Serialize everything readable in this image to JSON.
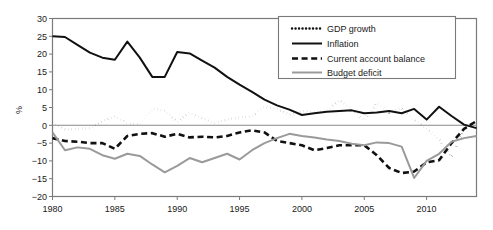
{
  "chart_data": {
    "type": "line",
    "title": "",
    "xlabel": "",
    "ylabel": "%",
    "xlim": [
      1980,
      2014
    ],
    "ylim": [
      -20,
      30
    ],
    "ytick_step": 5,
    "yticks": [
      30,
      25,
      20,
      15,
      10,
      5,
      0,
      -5,
      -10,
      -15,
      -20
    ],
    "xticks": [
      1980,
      1985,
      1990,
      1995,
      2000,
      2005,
      2010
    ],
    "grid": false,
    "zero_line": true,
    "legend_position": "top-right",
    "x": [
      1980,
      1981,
      1982,
      1983,
      1984,
      1985,
      1986,
      1987,
      1988,
      1989,
      1990,
      1991,
      1992,
      1993,
      1994,
      1995,
      1996,
      1997,
      1998,
      1999,
      2000,
      2001,
      2002,
      2003,
      2004,
      2005,
      2006,
      2007,
      2008,
      2009,
      2010,
      2011,
      2012,
      2013,
      2014
    ],
    "series": [
      {
        "name": "GDP growth",
        "style": "dotted",
        "color": "#111111",
        "values": [
          0.8,
          -1.2,
          -1.0,
          -0.8,
          1.2,
          2.5,
          0.6,
          0.2,
          4.6,
          4.1,
          1.0,
          3.5,
          2.0,
          0.6,
          1.6,
          2.2,
          2.6,
          5.2,
          4.6,
          3.0,
          4.0,
          3.6,
          4.0,
          7.0,
          4.6,
          1.4,
          6.2,
          3.6,
          4.8,
          1.6,
          -1.0,
          -4.0,
          -8.8,
          -1.2,
          1.2
        ]
      },
      {
        "name": "Inflation",
        "style": "solid",
        "color": "#111111",
        "values": [
          25.0,
          24.8,
          22.6,
          20.4,
          19.0,
          18.4,
          23.5,
          19.0,
          13.6,
          13.6,
          20.6,
          20.2,
          18.2,
          16.2,
          13.6,
          11.4,
          9.4,
          7.2,
          5.6,
          4.4,
          2.9,
          3.4,
          3.8,
          4.0,
          4.2,
          3.4,
          3.6,
          4.0,
          3.4,
          4.6,
          1.6,
          5.2,
          2.6,
          0.2,
          -0.8
        ]
      },
      {
        "name": "Current account balance",
        "style": "dashed",
        "color": "#111111",
        "values": [
          -3.6,
          -4.4,
          -4.6,
          -5.0,
          -5.0,
          -6.6,
          -3.0,
          -2.4,
          -2.2,
          -3.2,
          -2.4,
          -3.4,
          -3.2,
          -3.4,
          -3.0,
          -2.0,
          -1.4,
          -2.0,
          -4.4,
          -5.0,
          -5.6,
          -7.0,
          -6.4,
          -5.6,
          -5.6,
          -5.6,
          -8.4,
          -12.0,
          -13.4,
          -13.0,
          -10.4,
          -9.8,
          -5.0,
          -1.0,
          1.2
        ]
      },
      {
        "name": "Budget deficit",
        "style": "solid",
        "color": "#9a9a9a",
        "values": [
          -2.0,
          -7.0,
          -6.2,
          -6.6,
          -8.4,
          -9.4,
          -8.0,
          -8.6,
          -11.0,
          -13.2,
          -11.4,
          -9.2,
          -10.4,
          -9.2,
          -8.0,
          -9.6,
          -7.0,
          -5.0,
          -3.6,
          -2.4,
          -3.0,
          -3.4,
          -4.0,
          -4.4,
          -5.2,
          -5.6,
          -4.8,
          -5.0,
          -6.0,
          -14.8,
          -10.0,
          -8.0,
          -4.6,
          -3.6,
          -3.0
        ]
      }
    ]
  },
  "legend": {
    "entries": [
      {
        "label": "GDP growth",
        "sample": "dotted-line-sample"
      },
      {
        "label": "Inflation",
        "sample": "solid-black-line-sample"
      },
      {
        "label": "Current account balance",
        "sample": "dashed-line-sample"
      },
      {
        "label": "Budget deficit",
        "sample": "gray-line-sample"
      }
    ]
  },
  "axes": {
    "y_axis_title": "%",
    "y_tick_labels": [
      "30",
      "25",
      "20",
      "15",
      "10",
      "5",
      "0",
      "−5",
      "−10",
      "−15",
      "−20"
    ],
    "x_tick_labels": [
      "1980",
      "1985",
      "1990",
      "1995",
      "2000",
      "2005",
      "2010"
    ]
  }
}
